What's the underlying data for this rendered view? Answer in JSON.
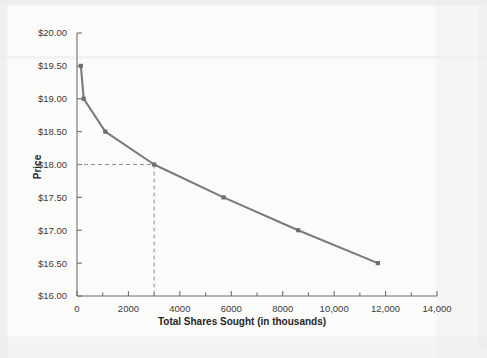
{
  "figure": {
    "background_color": "#fbfbfa",
    "page_color": "#f4f3f1"
  },
  "chart_data": {
    "type": "line",
    "title": "",
    "subtitle": "",
    "xlabel": "Total Shares Sought (in thousands)",
    "ylabel": "Price",
    "xlim": [
      0,
      14000
    ],
    "ylim": [
      16.0,
      20.0
    ],
    "grid": false,
    "legend": null,
    "line_color": "#7a7a7a",
    "marker_color": "#6e6e6e",
    "marker_shape": "square",
    "reference_line_color": "#8d8d8d",
    "x_tick_labels": [
      "0",
      "2000",
      "4000",
      "6000",
      "8000",
      "10,000",
      "12,000",
      "14,000"
    ],
    "x_tick_values": [
      0,
      2000,
      4000,
      6000,
      8000,
      10000,
      12000,
      14000
    ],
    "x_minor_tick_values": [
      1000,
      3000,
      5000,
      7000,
      9000,
      11000,
      13000
    ],
    "y_tick_labels": [
      "$16.00",
      "$16.50",
      "$17.00",
      "$17.50",
      "$18.00",
      "$18.50",
      "$19.00",
      "$19.50",
      "$20.00"
    ],
    "y_tick_values": [
      16.0,
      16.5,
      17.0,
      17.5,
      18.0,
      18.5,
      19.0,
      19.5,
      20.0
    ],
    "x": [
      150,
      260,
      1100,
      3000,
      5700,
      8600,
      11700
    ],
    "values": [
      19.5,
      19.0,
      18.5,
      18.0,
      17.5,
      17.0,
      16.5
    ],
    "points": [
      {
        "x": 150,
        "y": 19.5
      },
      {
        "x": 260,
        "y": 19.0
      },
      {
        "x": 1100,
        "y": 18.5
      },
      {
        "x": 3000,
        "y": 18.0
      },
      {
        "x": 5700,
        "y": 17.5
      },
      {
        "x": 8600,
        "y": 17.0
      },
      {
        "x": 11700,
        "y": 16.5
      }
    ],
    "annotations": [
      {
        "name": "clearing-price-reference",
        "type": "dashed-crosshair",
        "x": 3000,
        "y": 18.0
      }
    ]
  }
}
